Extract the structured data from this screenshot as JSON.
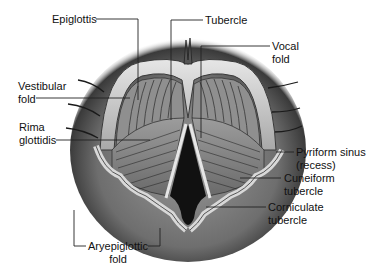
{
  "figure": {
    "colors": {
      "background": "#ffffff",
      "tissue_dark": "#3a3a3a",
      "tissue_mid": "#8a8a8a",
      "tissue_light": "#d8d8d8",
      "glottis_opening": "#111111",
      "leader_line": "#222222",
      "label_text": "#111111"
    }
  },
  "labels": {
    "epiglottis": {
      "lines": [
        "Epiglottis"
      ]
    },
    "tubercle": {
      "lines": [
        "Tubercle"
      ]
    },
    "vocal_fold": {
      "lines": [
        "Vocal",
        "fold"
      ]
    },
    "vestibular_fold": {
      "lines": [
        "Vestibular",
        "fold"
      ]
    },
    "rima_glottidis": {
      "lines": [
        "Rima",
        "glottidis"
      ]
    },
    "pyriform_sinus": {
      "lines": [
        "Pyriform sinus",
        "(recess)"
      ]
    },
    "cuneiform_tubercle": {
      "lines": [
        "Cuneiform",
        "tubercle"
      ]
    },
    "corniculate_tubercle": {
      "lines": [
        "Corniculate",
        "tubercle"
      ]
    },
    "aryepiglottic_fold": {
      "lines": [
        "Aryepiglottic",
        "fold"
      ]
    }
  }
}
